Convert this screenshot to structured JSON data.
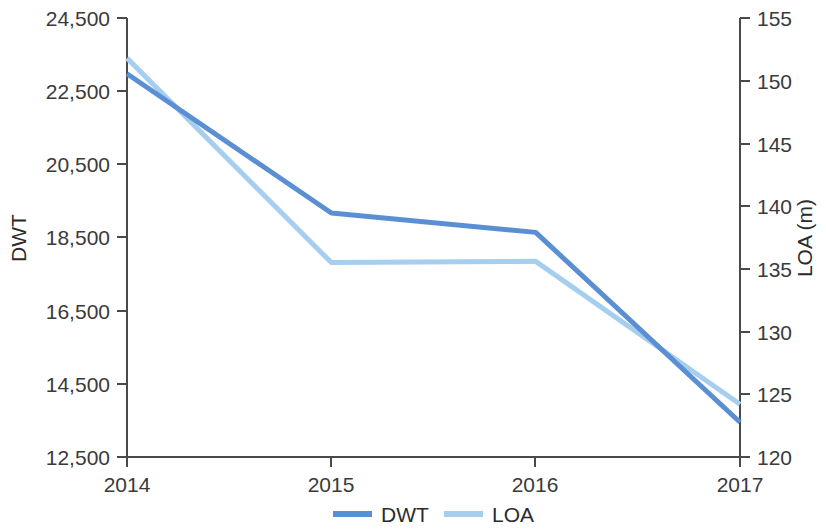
{
  "chart_data": {
    "type": "line",
    "title": "",
    "subtitle": "",
    "xlabel": "",
    "categories": [
      "2014",
      "2015",
      "2016",
      "2017"
    ],
    "series": [
      {
        "name": "DWT",
        "axis": "left",
        "color": "#5B8FD4",
        "values": [
          22975,
          19170,
          18640,
          13450
        ]
      },
      {
        "name": "LOA",
        "axis": "right",
        "color": "#A5CEEF",
        "values": [
          151.8,
          135.5,
          135.6,
          124.2
        ]
      }
    ],
    "left_axis": {
      "label": "DWT",
      "ticks": [
        "12,500",
        "14,500",
        "16,500",
        "18,500",
        "20,500",
        "22,500",
        "24,500"
      ],
      "tick_values": [
        12500,
        14500,
        16500,
        18500,
        20500,
        22500,
        24500
      ],
      "ylim": [
        12500,
        24500
      ]
    },
    "right_axis": {
      "label": "LOA (m)",
      "ticks": [
        "120",
        "125",
        "130",
        "135",
        "140",
        "145",
        "150",
        "155"
      ],
      "tick_values": [
        120,
        125,
        130,
        135,
        140,
        145,
        150,
        155
      ],
      "ylim": [
        120,
        155
      ]
    },
    "x_axis": {
      "ticks": [
        "2014",
        "2015",
        "2016",
        "2017"
      ]
    },
    "legend": {
      "position": "bottom-center",
      "entries": [
        {
          "label": "DWT",
          "color": "#5B8FD4"
        },
        {
          "label": "LOA",
          "color": "#A5CEEF"
        }
      ]
    },
    "grid": false
  }
}
